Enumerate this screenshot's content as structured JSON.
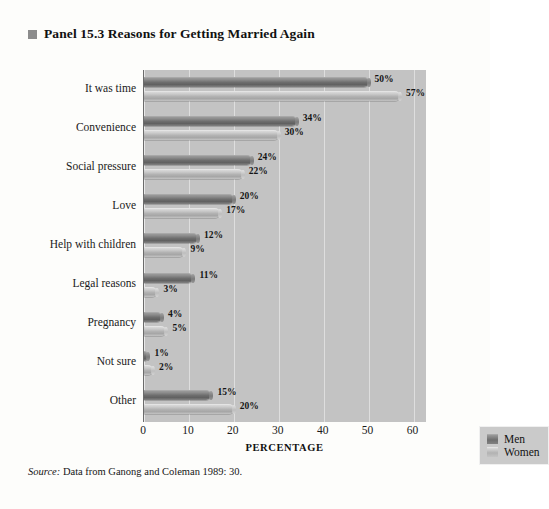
{
  "panel": {
    "marker": "square-marker-icon",
    "title": "Panel 15.3  Reasons for Getting Married Again"
  },
  "source": {
    "prefix": "Source:",
    "text": " Data from Ganong and Coleman 1989: 30."
  },
  "legend": {
    "position": "inside-bottom-right",
    "items": [
      {
        "label": "Men",
        "color": "#6e6e6e"
      },
      {
        "label": "Women",
        "color": "#b2b2b2"
      }
    ]
  },
  "colors": {
    "plot_background": "#c3c3c3",
    "page_background": "#fdfdfb",
    "men_bar": "#6e6e6e",
    "women_bar": "#b2b2b2",
    "gridline": "#dedede",
    "text": "#1a1a1a"
  },
  "chart_data": {
    "type": "bar",
    "orientation": "horizontal",
    "title": "Panel 15.3  Reasons for Getting Married Again",
    "xlabel": "PERCENTAGE",
    "ylabel": "",
    "xlim": [
      0,
      63
    ],
    "xticks": [
      0,
      10,
      20,
      30,
      40,
      50,
      60
    ],
    "xtick_labels": [
      "0",
      "10",
      "20",
      "30",
      "40",
      "50",
      "60"
    ],
    "grid": true,
    "legend_position": "lower right",
    "categories": [
      "It was time",
      "Convenience",
      "Social pressure",
      "Love",
      "Help with children",
      "Legal reasons",
      "Pregnancy",
      "Not sure",
      "Other"
    ],
    "series": [
      {
        "name": "Men",
        "values": [
          50,
          34,
          24,
          20,
          12,
          11,
          4,
          1,
          15
        ],
        "labels": [
          "50%",
          "34%",
          "24%",
          "20%",
          "12%",
          "11%",
          "4%",
          "1%",
          "15%"
        ]
      },
      {
        "name": "Women",
        "values": [
          57,
          30,
          22,
          17,
          9,
          3,
          5,
          2,
          20
        ],
        "labels": [
          "57%",
          "30%",
          "22%",
          "17%",
          "9%",
          "3%",
          "5%",
          "2%",
          "20%"
        ]
      }
    ]
  }
}
